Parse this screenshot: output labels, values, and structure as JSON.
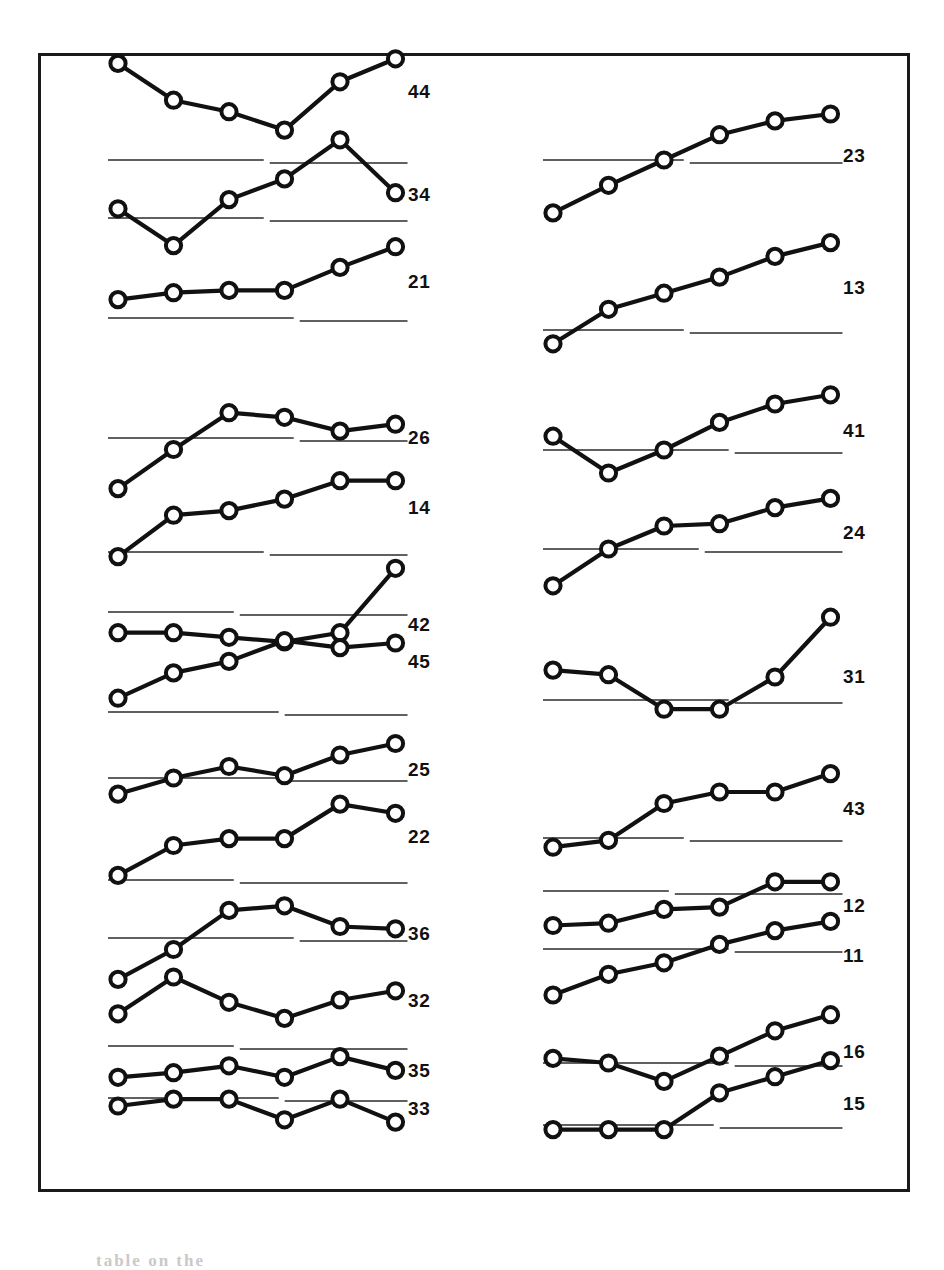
{
  "figure": {
    "frame": {
      "x": 38,
      "y": 53,
      "width": 872,
      "height": 1139
    },
    "background_color": "#ffffff",
    "ink_color": "#111111",
    "baseline_color": "#2b2b2b",
    "caption_fragment": "table on the"
  },
  "chart_data": {
    "type": "line",
    "title": "",
    "subtitle": "",
    "xlabel": "",
    "ylabel": "",
    "grid": false,
    "legend_position": "right",
    "x": [
      1,
      2,
      3,
      4,
      5,
      6
    ],
    "n_panels": 23,
    "points_per_panel": 6,
    "marker": "open-circle",
    "panels": [
      {
        "label": "44",
        "column": "left",
        "row": 1,
        "values": [
          5.2,
          3.6,
          3.1,
          2.3,
          4.4,
          5.4
        ],
        "baseline": 1.0,
        "ylim": [
          0,
          6.5
        ]
      },
      {
        "label": "34",
        "column": "left",
        "row": 2,
        "values": [
          2.6,
          1.0,
          3.0,
          3.9,
          5.6,
          3.3
        ],
        "baseline": 2.2,
        "ylim": [
          0,
          6.5
        ]
      },
      {
        "label": "21",
        "column": "left",
        "row": 3,
        "values": [
          2.0,
          2.3,
          2.4,
          2.4,
          3.4,
          4.3
        ],
        "baseline": 1.2,
        "ylim": [
          0,
          6.5
        ]
      },
      {
        "label": "26",
        "column": "left",
        "row": 4,
        "values": [
          1.4,
          3.1,
          4.7,
          4.5,
          3.9,
          4.2
        ],
        "baseline": 3.6,
        "ylim": [
          0,
          6.5
        ]
      },
      {
        "label": "14",
        "column": "left",
        "row": 5,
        "values": [
          1.0,
          2.8,
          3.0,
          3.5,
          4.3,
          4.3
        ],
        "baseline": 1.2,
        "ylim": [
          0,
          6.5
        ]
      },
      {
        "label": "42",
        "column": "left",
        "row": 6,
        "values": [
          2.4,
          2.4,
          2.2,
          2.0,
          2.4,
          5.2
        ],
        "baseline": 3.3,
        "ylim": [
          0,
          6.5
        ]
      },
      {
        "label": "45",
        "column": "left",
        "row": 7,
        "values": [
          1.3,
          2.4,
          2.9,
          3.8,
          3.5,
          3.7
        ],
        "baseline": 0.7,
        "ylim": [
          0,
          6.5
        ]
      },
      {
        "label": "25",
        "column": "left",
        "row": 8,
        "values": [
          1.9,
          2.6,
          3.1,
          2.7,
          3.6,
          4.1
        ],
        "baseline": 2.6,
        "ylim": [
          0,
          6.5
        ]
      },
      {
        "label": "22",
        "column": "left",
        "row": 9,
        "values": [
          1.3,
          2.6,
          2.9,
          2.9,
          4.4,
          4.0
        ],
        "baseline": 1.1,
        "ylim": [
          0,
          6.5
        ]
      },
      {
        "label": "36",
        "column": "left",
        "row": 10,
        "values": [
          1.1,
          2.4,
          4.1,
          4.3,
          3.4,
          3.3
        ],
        "baseline": 2.9,
        "ylim": [
          0,
          6.5
        ]
      },
      {
        "label": "32",
        "column": "left",
        "row": 11,
        "values": [
          2.5,
          4.1,
          3.0,
          2.3,
          3.1,
          3.5
        ],
        "baseline": 1.1,
        "ylim": [
          0,
          6.5
        ]
      },
      {
        "label": "35",
        "column": "left",
        "row": 12,
        "values": [
          2.5,
          2.7,
          3.0,
          2.5,
          3.4,
          2.8
        ],
        "baseline": 1.6,
        "ylim": [
          0,
          6.5
        ]
      },
      {
        "label": "33",
        "column": "left",
        "row": 13,
        "values": [
          3.0,
          3.3,
          3.3,
          2.4,
          3.3,
          2.3
        ],
        "baseline": null,
        "ylim": [
          0,
          6.5
        ]
      },
      {
        "label": "23",
        "column": "right",
        "row": 1,
        "values": [
          1.6,
          2.8,
          3.9,
          5.0,
          5.6,
          5.9
        ],
        "baseline": 3.9,
        "ylim": [
          0,
          6.5
        ]
      },
      {
        "label": "13",
        "column": "right",
        "row": 2,
        "values": [
          0.6,
          2.1,
          2.8,
          3.5,
          4.4,
          5.0
        ],
        "baseline": 1.2,
        "ylim": [
          0,
          6.5
        ]
      },
      {
        "label": "41",
        "column": "right",
        "row": 3,
        "values": [
          3.4,
          1.8,
          2.8,
          4.0,
          4.8,
          5.2
        ],
        "baseline": 2.8,
        "ylim": [
          0,
          6.5
        ]
      },
      {
        "label": "24",
        "column": "right",
        "row": 4,
        "values": [
          0.8,
          2.4,
          3.4,
          3.5,
          4.2,
          4.6
        ],
        "baseline": 2.4,
        "ylim": [
          0,
          6.5
        ]
      },
      {
        "label": "31",
        "column": "right",
        "row": 5,
        "values": [
          3.6,
          3.4,
          1.9,
          1.9,
          3.3,
          5.9
        ],
        "baseline": 2.3,
        "ylim": [
          0,
          6.5
        ]
      },
      {
        "label": "43",
        "column": "right",
        "row": 6,
        "values": [
          1.2,
          1.5,
          3.1,
          3.6,
          3.6,
          4.4
        ],
        "baseline": 1.6,
        "ylim": [
          0,
          6.5
        ]
      },
      {
        "label": "12",
        "column": "right",
        "row": 7,
        "values": [
          2.2,
          2.3,
          2.9,
          3.0,
          4.1,
          4.1
        ],
        "baseline": 3.7,
        "ylim": [
          0,
          6.5
        ]
      },
      {
        "label": "11",
        "column": "right",
        "row": 8,
        "values": [
          1.2,
          2.1,
          2.6,
          3.4,
          4.0,
          4.4
        ],
        "baseline": 3.2,
        "ylim": [
          0,
          6.5
        ]
      },
      {
        "label": "16",
        "column": "right",
        "row": 9,
        "values": [
          3.1,
          2.9,
          2.1,
          3.2,
          4.3,
          5.0
        ],
        "baseline": 2.9,
        "ylim": [
          0,
          6.5
        ]
      },
      {
        "label": "15",
        "column": "right",
        "row": 10,
        "values": [
          1.1,
          1.1,
          1.1,
          2.7,
          3.4,
          4.1
        ],
        "baseline": 1.3,
        "ylim": [
          0,
          6.5
        ]
      }
    ]
  },
  "geometry": {
    "left_column": {
      "x_start": 118,
      "x_step": 55.5,
      "label_x": 408
    },
    "right_column": {
      "x_start": 553,
      "x_step": 55.5,
      "label_x": 843
    },
    "unit_px": 23.0,
    "panel_baseline_y": {
      "44": 160,
      "34": 218,
      "21": 318,
      "26": 438,
      "14": 552,
      "42": 612,
      "45": 712,
      "25": 778,
      "22": 880,
      "36": 938,
      "32": 1046,
      "35": 1098,
      "33": 1175,
      "23": 160,
      "13": 330,
      "41": 450,
      "24": 549,
      "31": 700,
      "43": 838,
      "12": 891,
      "11": 949,
      "16": 1063,
      "15": 1125
    }
  }
}
